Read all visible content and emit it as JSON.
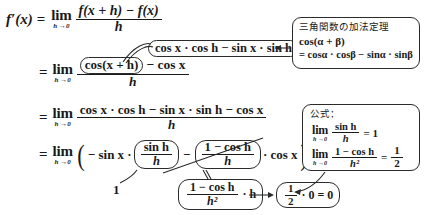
{
  "document": {
    "kind": "math-derivation",
    "subject": "derivative-of-cosine"
  },
  "derivation": {
    "line1": {
      "lhs": "f′(x)",
      "equals": "=",
      "lim_op": "lim",
      "lim_sub": "h →0",
      "numerator": "f(x + h) − f(x)",
      "denominator": "h"
    },
    "line2": {
      "equals": "=",
      "lim_op": "lim",
      "lim_sub": "h →0",
      "num_boxed": "cos(x + h)",
      "num_rest": "− cos x",
      "denominator": "h"
    },
    "line3": {
      "equals": "=",
      "lim_op": "lim",
      "lim_sub": "h →0",
      "numerator": "cos x · cos h − sin x · sin h − cos x",
      "denominator": "h"
    },
    "line4": {
      "equals": "=",
      "lim_op": "lim",
      "lim_sub": "h →0",
      "open_paren": "(",
      "term1": "− sin x ·",
      "frac1_num": "sin h",
      "frac1_den": "h",
      "minus": "−",
      "frac2_num": "1 − cos h",
      "frac2_den": "h",
      "term2": "· cos x",
      "close_paren": ")"
    }
  },
  "callouts": {
    "expansion": {
      "text": "cos x · cos h − sin x · sin h"
    },
    "limit_one": {
      "value": "1"
    },
    "rewrite": {
      "frac_num": "1 − cos h",
      "frac_den": "h²",
      "times": "· h"
    },
    "result": {
      "text": "½ · 0 = 0",
      "half_num": "1",
      "half_den": "2",
      "rest": "· 0 = 0"
    }
  },
  "notes": {
    "addition_theorem": {
      "title": "三角関数の加法定理",
      "line1": "cos(α + β)",
      "line2": "= cosα · cosβ − sinα · sinβ"
    },
    "formulas": {
      "title": "公式：",
      "f1_lim": "lim",
      "f1_sub": "h →0",
      "f1_num": "sin h",
      "f1_den": "h",
      "f1_eq": "= 1",
      "f2_lim": "lim",
      "f2_sub": "h →0",
      "f2_num": "1 − cos h",
      "f2_den": "h²",
      "f2_eq": "=",
      "f2_val_num": "1",
      "f2_val_den": "2"
    }
  },
  "colors": {
    "ink": "#1a1a1a",
    "stroke": "#2b2b2b",
    "background": "#ffffff"
  }
}
